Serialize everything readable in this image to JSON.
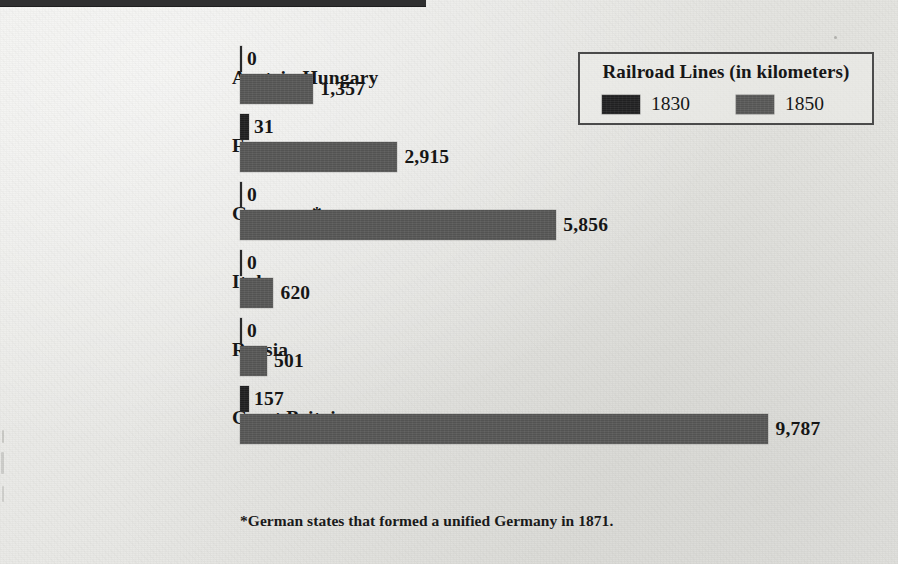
{
  "top_rule": {
    "present": true,
    "color": "#2f2f30"
  },
  "legend": {
    "title": "Railroad Lines (in kilometers)",
    "entries": [
      {
        "label": "1830",
        "color": "#222223",
        "icon": "legend-swatch-icon"
      },
      {
        "label": "1850",
        "color": "#5a5a59",
        "icon": "legend-swatch-icon"
      }
    ]
  },
  "footnote": "*German states that formed a unified Germany in 1871.",
  "colors": {
    "background": "#e9e9e6",
    "series_1830": "#202021",
    "series_1850": "#585857",
    "text": "#161616",
    "legend_border": "#4b4b4b"
  },
  "chart_data": {
    "type": "bar",
    "orientation": "horizontal",
    "title": "Railroad Lines (in kilometers)",
    "xlabel": "",
    "ylabel": "",
    "grid": false,
    "legend_position": "top-right",
    "xlim": [
      0,
      9787
    ],
    "categories": [
      "Austria-Hungary",
      "France",
      "Germany*",
      "Italy",
      "Russia",
      "Great Britain"
    ],
    "series": [
      {
        "name": "1830",
        "color": "#202021",
        "values": [
          0,
          31,
          0,
          0,
          0,
          157
        ],
        "labels": [
          "0",
          "31",
          "0",
          "0",
          "0",
          "157"
        ]
      },
      {
        "name": "1850",
        "color": "#585857",
        "values": [
          1357,
          2915,
          5856,
          620,
          501,
          9787
        ],
        "labels": [
          "1,357",
          "2,915",
          "5,856",
          "620",
          "501",
          "9,787"
        ]
      }
    ],
    "footnote": "*German states that formed a unified Germany in 1871."
  }
}
